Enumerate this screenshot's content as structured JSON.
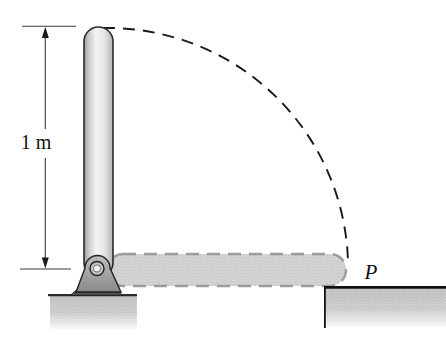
{
  "figure": {
    "kind": "rigid-rod-swing-diagram",
    "labels": {
      "rod_length": "1 m",
      "impact_point": "P"
    },
    "colors": {
      "background": "#ffffff",
      "outline": "#222222",
      "arc_stroke": "#1a1a1a",
      "rod_highlight": "#f5f5f5",
      "rod_shadow": "#9e9e9e",
      "ghost_rod_fill": "#d7d7d7",
      "ground_fill": "#c9c9c9",
      "bracket_fill": "#a8a8a8",
      "dimension_stroke": "#3a3a3a",
      "label_color": "#111111"
    }
  }
}
